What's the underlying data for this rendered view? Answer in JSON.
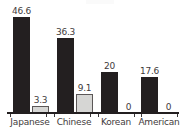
{
  "chart_data": {
    "type": "bar",
    "title": "",
    "xlabel": "",
    "ylabel": "",
    "ylim": [
      0,
      52
    ],
    "grid": false,
    "legend": "none",
    "categories": [
      "Japanese",
      "Chinese",
      "Korean",
      "American"
    ],
    "series": [
      {
        "name": "dark",
        "color": "#231f20",
        "values": [
          46.6,
          36.3,
          20,
          17.6
        ],
        "labels": [
          "46.6",
          "36.3",
          "20",
          "17.6"
        ]
      },
      {
        "name": "light",
        "color": "#d6d6d4",
        "values": [
          3.3,
          9.1,
          0,
          0
        ],
        "labels": [
          "3.3",
          "9.1",
          "0",
          "0"
        ]
      }
    ]
  },
  "axis": {
    "baseline_color": "#231f20"
  }
}
